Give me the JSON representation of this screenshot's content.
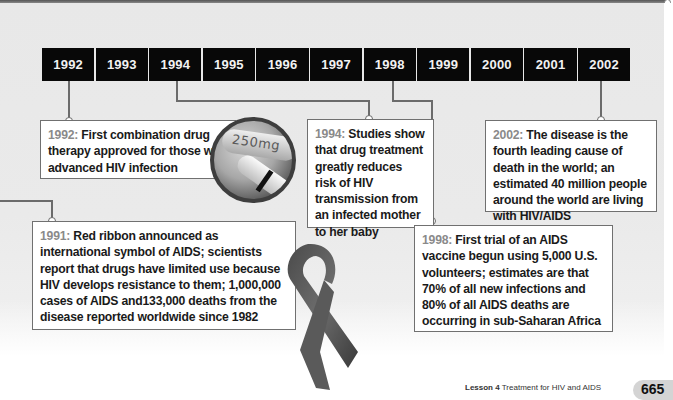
{
  "timeline": {
    "years": [
      "1992",
      "1993",
      "1994",
      "1995",
      "1996",
      "1997",
      "1998",
      "1999",
      "2000",
      "2001",
      "2002"
    ]
  },
  "events": [
    {
      "year": "1992:",
      "text": " First combination drug therapy approved for those with advanced HIV infection"
    },
    {
      "year": "1994:",
      "text": " Studies show that drug treatment greatly reduces risk of HIV transmission from an infected mother to her baby"
    },
    {
      "year": "2002:",
      "text": " The disease is the fourth leading cause of death in the world; an estimated 40 million people around the world are living with HIV/AIDS"
    },
    {
      "year": "1991:",
      "text": " Red ribbon announced as international symbol of AIDS; scientists report that drugs have limited use because HIV develops resistance to them; 1,000,000 cases of AIDS and133,000 deaths from the disease reported worldwide since 1982"
    },
    {
      "year": "1998:",
      "text": " First trial of an AIDS vaccine begun using 5,000 U.S. volunteers; estimates are that 70% of all new infections and 80% of all AIDS deaths are occurring in sub-Saharan Africa"
    }
  ],
  "images": {
    "pill_label": "250mg"
  },
  "footer": {
    "lesson": "Lesson 4",
    "title": "Treatment for HIV and AIDS",
    "page": "665"
  }
}
